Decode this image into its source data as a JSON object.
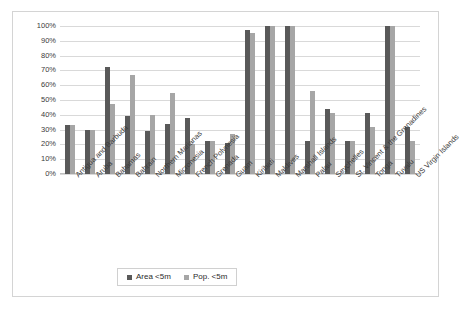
{
  "chart_data": {
    "type": "bar",
    "title": "",
    "xlabel": "",
    "ylabel": "",
    "ylim": [
      0,
      100
    ],
    "ytick_labels": [
      "100%",
      "90%",
      "80%",
      "70%",
      "60%",
      "50%",
      "40%",
      "30%",
      "20%",
      "10%",
      "0%"
    ],
    "ytick_values": [
      100,
      90,
      80,
      70,
      60,
      50,
      40,
      30,
      20,
      10,
      0
    ],
    "grid": true,
    "legend_position": "bottom",
    "categories": [
      "Antigua and Barbuda",
      "Aruba",
      "Bahamas",
      "Bahrain",
      "Northern Marianas",
      "Micronesia",
      "French Polynesia",
      "Grenada",
      "Guam",
      "Kiribati",
      "Maldives",
      "Marshall Islands",
      "Palau",
      "Seychelles",
      "St. Vincent & the Grenadines",
      "Tonga",
      "Tuvalu",
      "US Virgin Islands"
    ],
    "series": [
      {
        "name": "Area <5m",
        "color": "#595959",
        "values": [
          33,
          30,
          72,
          39,
          29,
          34,
          38,
          22,
          21,
          97,
          100,
          100,
          22,
          44,
          22,
          41,
          100,
          32
        ]
      },
      {
        "name": "Pop. <5m",
        "color": "#a6a6a6",
        "values": [
          33,
          30,
          47,
          67,
          40,
          55,
          20,
          22,
          27,
          95,
          100,
          100,
          56,
          41,
          22,
          32,
          100,
          22
        ]
      }
    ]
  },
  "legend": {
    "items": [
      {
        "label": "Area <5m",
        "color": "#595959"
      },
      {
        "label": "Pop. <5m",
        "color": "#a6a6a6"
      }
    ]
  }
}
